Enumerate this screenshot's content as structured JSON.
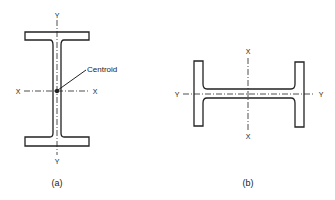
{
  "figure_a": {
    "caption": "(a)",
    "axis_labels": {
      "y_top": "Y",
      "y_bottom": "Y",
      "x_left": "X",
      "x_right": "X"
    },
    "annotation": "Centroid"
  },
  "figure_b": {
    "caption": "(b)",
    "axis_labels": {
      "x_top": "X",
      "x_bottom": "X",
      "y_left": "Y",
      "y_right": "Y"
    }
  },
  "colors": {
    "stroke": "#222222",
    "background": "#ffffff"
  }
}
